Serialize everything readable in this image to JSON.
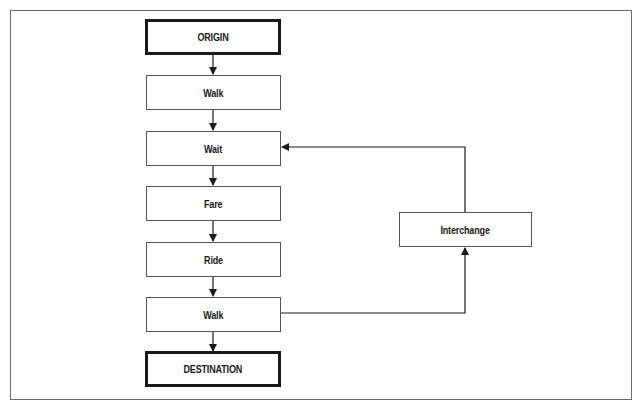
{
  "diagram": {
    "type": "flowchart",
    "nodes": [
      {
        "id": "origin",
        "label": "ORIGIN",
        "kind": "terminal"
      },
      {
        "id": "walk1",
        "label": "Walk",
        "kind": "process"
      },
      {
        "id": "wait",
        "label": "Wait",
        "kind": "process"
      },
      {
        "id": "fare",
        "label": "Fare",
        "kind": "process"
      },
      {
        "id": "ride",
        "label": "Ride",
        "kind": "process"
      },
      {
        "id": "walk2",
        "label": "Walk",
        "kind": "process"
      },
      {
        "id": "destination",
        "label": "DESTINATION",
        "kind": "terminal"
      },
      {
        "id": "interchange",
        "label": "Interchange",
        "kind": "process"
      }
    ],
    "edges": [
      {
        "from": "origin",
        "to": "walk1"
      },
      {
        "from": "walk1",
        "to": "wait"
      },
      {
        "from": "wait",
        "to": "fare"
      },
      {
        "from": "fare",
        "to": "ride"
      },
      {
        "from": "ride",
        "to": "walk2"
      },
      {
        "from": "walk2",
        "to": "destination"
      },
      {
        "from": "walk2",
        "to": "interchange"
      },
      {
        "from": "interchange",
        "to": "wait"
      }
    ],
    "colors": {
      "line": "#1a1a1a",
      "frame": "#6a6a6a",
      "background": "#ffffff"
    }
  }
}
